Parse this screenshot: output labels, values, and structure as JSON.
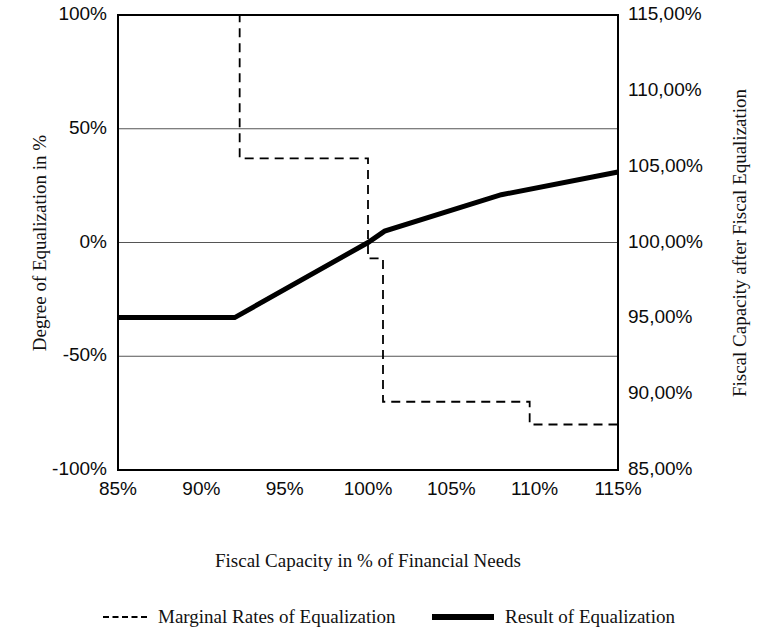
{
  "chart_data": {
    "type": "line",
    "title": "",
    "xlabel": "Fiscal Capacity in % of Financial Needs",
    "ylabel": "Degree of Equalization in %",
    "ylabel_secondary": "Fiscal Capacity after Fiscal Equalization",
    "grid": true,
    "legend_position": "bottom",
    "xlim": [
      85,
      115
    ],
    "xticks": [
      85,
      90,
      95,
      100,
      105,
      110,
      115
    ],
    "xticklabels": [
      "85%",
      "90%",
      "95%",
      "100%",
      "105%",
      "110%",
      "115%"
    ],
    "ylim": [
      -100,
      100
    ],
    "yticks": [
      -100,
      -50,
      0,
      50,
      100
    ],
    "yticklabels": [
      "-100%",
      "-50%",
      "0%",
      "50%",
      "100%"
    ],
    "ylim_secondary": [
      85,
      115
    ],
    "yticks_secondary": [
      85,
      90,
      95,
      100,
      105,
      110,
      115
    ],
    "yticklabels_secondary": [
      "85,00%",
      "90,00%",
      "95,00%",
      "100,00%",
      "105,00%",
      "110,00%",
      "115,00%"
    ],
    "series": [
      {
        "name": "Marginal Rates of Equalization",
        "style": "dashed",
        "axis": "left",
        "type": "step",
        "points": [
          {
            "x": 85.0,
            "y": 100
          },
          {
            "x": 92.3,
            "y": 100
          },
          {
            "x": 92.3,
            "y": 37
          },
          {
            "x": 100.0,
            "y": 37
          },
          {
            "x": 100.0,
            "y": -7
          },
          {
            "x": 100.9,
            "y": -7
          },
          {
            "x": 100.9,
            "y": -70
          },
          {
            "x": 109.7,
            "y": -70
          },
          {
            "x": 109.7,
            "y": -80
          },
          {
            "x": 115.0,
            "y": -80
          }
        ]
      },
      {
        "name": "Result of Equalization",
        "style": "solid",
        "axis": "left",
        "type": "piecewise",
        "points": [
          {
            "x": 85.0,
            "y": -33
          },
          {
            "x": 92.0,
            "y": -33
          },
          {
            "x": 100.0,
            "y": 0
          },
          {
            "x": 101.0,
            "y": 5
          },
          {
            "x": 108.0,
            "y": 21
          },
          {
            "x": 115.0,
            "y": 31
          }
        ]
      }
    ]
  },
  "legend": {
    "marginal_label": "Marginal Rates of Equalization",
    "result_label": "Result of Equalization"
  },
  "colors": {
    "line": "#000000",
    "grid": "#555555",
    "axis": "#000000",
    "background": "#ffffff"
  }
}
